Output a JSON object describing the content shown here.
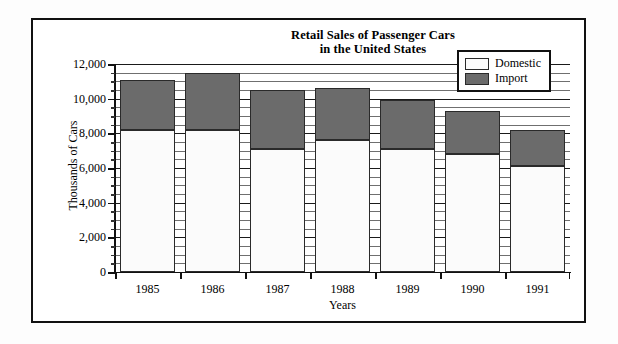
{
  "chart_data": {
    "type": "bar",
    "subtype": "stacked-vertical",
    "title": "Retail Sales of Passenger Cars in the United States",
    "title_line1": "Retail Sales of Passenger Cars",
    "title_line2": "in the United States",
    "xlabel": "Years",
    "ylabel": "Thousands of Cars",
    "categories": [
      "1985",
      "1986",
      "1987",
      "1988",
      "1989",
      "1990",
      "1991"
    ],
    "series": [
      {
        "name": "Domestic",
        "color": "#fbfbfb",
        "values": [
          8200,
          8200,
          7100,
          7600,
          7100,
          6800,
          6100
        ]
      },
      {
        "name": "Import",
        "color": "#6b6b6b",
        "values": [
          2900,
          3300,
          3400,
          3000,
          2800,
          2500,
          2100
        ]
      }
    ],
    "totals": [
      11100,
      11500,
      10500,
      10600,
      9900,
      9300,
      8200
    ],
    "ylim": [
      0,
      12000
    ],
    "ytick_values": [
      0,
      2000,
      4000,
      6000,
      8000,
      10000,
      12000
    ],
    "ytick_labels": [
      "0",
      "2,000",
      "4,000",
      "6,000",
      "8,000",
      "10,000",
      "12,000"
    ],
    "yminor_step": 500,
    "grid": true,
    "grid_axis": "y",
    "legend_position": "top-right",
    "legend_entries": [
      "Domestic",
      "Import"
    ]
  }
}
